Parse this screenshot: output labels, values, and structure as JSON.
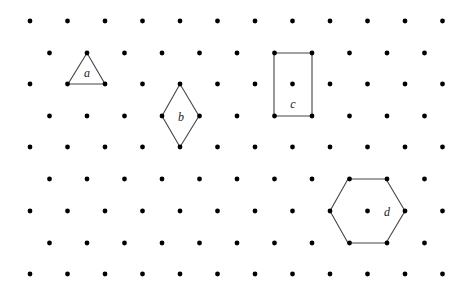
{
  "figure": {
    "type": "isometric-dot-grid",
    "colors": {
      "dot": "#000000",
      "shape_stroke": "#444444",
      "label": "#222222",
      "background": "#ffffff"
    },
    "grid": {
      "row_y": [
        21,
        53,
        84,
        116,
        147,
        179,
        211,
        243,
        274
      ],
      "even_row_x_start": 30,
      "odd_row_x_start": 49.5,
      "x_step": 37.5,
      "even_row_count": 12,
      "odd_row_count": 11,
      "dot_radius": 2.4
    },
    "shapes": [
      {
        "id": "a",
        "name": "triangle",
        "label": "a",
        "points": [
          [
            87,
            53
          ],
          [
            68,
            84
          ],
          [
            105,
            84
          ]
        ],
        "label_pos": [
          87,
          77
        ]
      },
      {
        "id": "b",
        "name": "rhombus",
        "label": "b",
        "points": [
          [
            180,
            84
          ],
          [
            162,
            116
          ],
          [
            180,
            147
          ],
          [
            199,
            116
          ]
        ],
        "label_pos": [
          181,
          121
        ]
      },
      {
        "id": "c",
        "name": "rectangle",
        "label": "c",
        "points": [
          [
            274,
            53
          ],
          [
            312,
            53
          ],
          [
            312,
            116
          ],
          [
            274,
            116
          ]
        ],
        "label_pos": [
          293,
          108
        ]
      },
      {
        "id": "d",
        "name": "hexagon",
        "label": "d",
        "points": [
          [
            348,
            179
          ],
          [
            386,
            179
          ],
          [
            405,
            211
          ],
          [
            386,
            243
          ],
          [
            348,
            243
          ],
          [
            330,
            211
          ]
        ],
        "label_pos": [
          387,
          216
        ]
      }
    ]
  }
}
